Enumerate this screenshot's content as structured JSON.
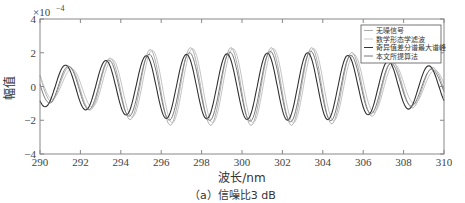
{
  "chart_data": {
    "type": "line",
    "title": "",
    "xlabel": "波长/nm",
    "ylabel": "幅值",
    "y_scale_label": "×10⁻⁴",
    "caption": "（a）信噪比3 dB",
    "xlim": [
      290,
      310
    ],
    "ylim": [
      -4,
      4
    ],
    "y_multiplier": 0.0001,
    "xticks": [
      290,
      292,
      294,
      296,
      298,
      300,
      302,
      304,
      306,
      308,
      310
    ],
    "yticks": [
      4,
      2,
      0,
      -2,
      -4
    ],
    "grid": false,
    "legend_position": "upper right",
    "legend": [
      "无噪信号",
      "数学形态学滤波",
      "奇异值差分谱最大谱峰",
      "本文所提算法"
    ],
    "x": [
      290,
      290.5,
      291,
      291.5,
      292,
      292.5,
      293,
      293.5,
      294,
      294.5,
      295,
      295.5,
      296,
      296.5,
      297,
      297.5,
      298,
      298.5,
      299,
      299.5,
      300,
      300.5,
      301,
      301.5,
      302,
      302.5,
      303,
      303.5,
      304,
      304.5,
      305,
      305.5,
      306,
      306.5,
      307,
      307.5,
      308,
      308.5,
      309,
      309.5,
      310
    ],
    "series": [
      {
        "name": "无噪信号",
        "color": "#aaaaaa",
        "width": 1.0,
        "values": [
          0.9,
          -0.6,
          -0.3,
          0.6,
          0.7,
          -0.6,
          -1.2,
          0.3,
          1.0,
          -0.1,
          -1.8,
          -0.2,
          1.9,
          0.1,
          -2.1,
          -0.1,
          2.2,
          0.0,
          -2.4,
          0.0,
          2.3,
          0.0,
          -2.4,
          0.0,
          2.3,
          0.0,
          -2.3,
          0.0,
          2.3,
          0.0,
          -2.1,
          0.0,
          1.9,
          0.1,
          -1.7,
          0.0,
          1.0,
          0.2,
          -1.3,
          0.2,
          0.9
        ]
      },
      {
        "name": "数学形态学滤波",
        "color": "#c8c8c8",
        "width": 1.0,
        "values": [
          0.6,
          -0.4,
          -0.8,
          0.3,
          1.0,
          0.2,
          -1.3,
          -0.4,
          1.2,
          0.4,
          -1.8,
          -0.4,
          1.8,
          0.1,
          -2.0,
          -0.2,
          2.1,
          0.0,
          -2.2,
          0.0,
          2.2,
          0.0,
          -2.2,
          0.0,
          2.1,
          0.0,
          -2.1,
          0.0,
          2.1,
          0.0,
          -2.0,
          0.0,
          1.8,
          0.3,
          -1.6,
          -0.2,
          0.7,
          0.5,
          -1.1,
          0.0,
          0.7
        ]
      },
      {
        "name": "奇异值差分谱最大谱峰",
        "color": "#333333",
        "width": 1.1,
        "values": [
          -0.8,
          -1.0,
          0.4,
          1.3,
          0.3,
          -1.5,
          -0.6,
          1.6,
          0.6,
          -1.8,
          -0.3,
          1.8,
          0.3,
          -2.0,
          -0.2,
          2.0,
          0.1,
          -2.0,
          0.0,
          2.0,
          0.0,
          -2.0,
          0.0,
          2.0,
          0.0,
          -2.0,
          0.0,
          1.9,
          0.1,
          -1.9,
          0.0,
          1.9,
          -0.1,
          -1.6,
          -0.3,
          1.3,
          0.3,
          -1.5,
          0.2,
          1.2,
          0.3
        ]
      },
      {
        "name": "本文所提算法",
        "color": "#777777",
        "width": 1.0,
        "values": [
          0.3,
          -0.9,
          -0.5,
          0.9,
          1.1,
          -0.3,
          -1.4,
          -0.1,
          1.4,
          0.3,
          -1.8,
          -0.2,
          1.8,
          0.1,
          -2.0,
          -0.1,
          2.0,
          0.0,
          -2.1,
          0.0,
          2.1,
          0.0,
          -2.1,
          0.0,
          2.0,
          0.0,
          -2.1,
          0.0,
          2.0,
          0.0,
          -1.9,
          0.0,
          1.8,
          0.2,
          -1.5,
          0.0,
          0.8,
          0.4,
          -1.2,
          0.1,
          0.8
        ]
      }
    ],
    "model": {
      "description": "curves rendered from damped sinusoid model approximating the figure",
      "period_nm": 2.0,
      "curves": [
        {
          "phase_peak": 291.45,
          "amp": [
            1.0,
            2.3,
            2.3,
            1.1
          ],
          "offset": 0.0,
          "color": "#b0b0b0"
        },
        {
          "phase_peak": 291.55,
          "amp": [
            0.8,
            2.2,
            2.2,
            0.9
          ],
          "offset": 0.05,
          "color": "#c4c4c4"
        },
        {
          "phase_peak": 291.25,
          "amp": [
            1.2,
            1.9,
            2.0,
            1.2
          ],
          "offset": 0.0,
          "color": "#2f2f2f"
        },
        {
          "phase_peak": 291.4,
          "amp": [
            1.1,
            2.0,
            2.1,
            1.0
          ],
          "offset": 0.0,
          "color": "#7a7a7a"
        }
      ]
    }
  },
  "axes": {
    "y_scale_label": "×10",
    "y_scale_exp": "−4"
  }
}
